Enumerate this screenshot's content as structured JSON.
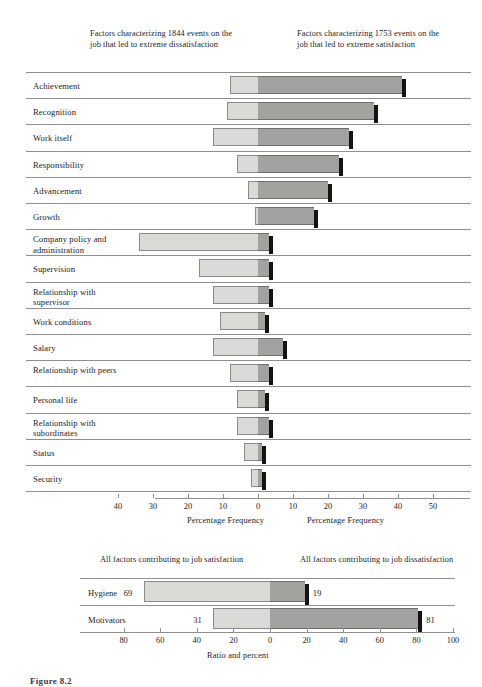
{
  "figure": {
    "caption": "Figure 8.2"
  },
  "top": {
    "left_header": "Factors characterizing 1844 events on the job that led to extreme dissatisfaction",
    "right_header": "Factors characterizing 1753 events on the job that led to extreme satisfaction",
    "left_axis_title": "Percentage Frequency",
    "right_axis_title": "Percentage Frequency"
  },
  "bottom": {
    "left_header": "All factors contributing to job satisfaction",
    "right_header": "All factors contributing to job dissatisfaction",
    "axis_title": "Ratio and percent"
  },
  "colors": {
    "light_bar": "#d9d9d7",
    "dark_bar": "#a2a2a0",
    "shadow": "#141414",
    "rule": "#8f8f8f",
    "text": "#1c1c22"
  },
  "chart_data": [
    {
      "type": "bar",
      "orientation": "horizontal-diverging",
      "title": "Factors affecting job attitudes as reported in 12 investigations",
      "xlabel": "Percentage Frequency",
      "left_label": "Factors characterizing 1844 events on the job that led to extreme dissatisfaction",
      "right_label": "Factors characterizing 1753 events on the job that led to extreme satisfaction",
      "left_ticks": [
        50,
        40,
        30,
        20,
        10,
        0
      ],
      "right_ticks": [
        0,
        10,
        20,
        30,
        40,
        50
      ],
      "xlim": [
        -50,
        50
      ],
      "grid": false,
      "legend": "none",
      "categories": [
        "Achievement",
        "Recognition",
        "Work itself",
        "Responsibility",
        "Advancement",
        "Growth",
        "Company policy and administration",
        "Supervision",
        "Relationship with supervisor",
        "Work conditions",
        "Salary",
        "Relationship with peers",
        "Personal life",
        "Relationship with subordinates",
        "Status",
        "Security"
      ],
      "series": [
        {
          "name": "Dissatisfaction (left, light)",
          "values": [
            8,
            9,
            13,
            6,
            3,
            1,
            34,
            17,
            13,
            11,
            13,
            8,
            6,
            6,
            4,
            2
          ]
        },
        {
          "name": "Satisfaction (right, dark)",
          "values": [
            41,
            33,
            26,
            23,
            20,
            16,
            3,
            3,
            3,
            2,
            7,
            3,
            2,
            3,
            1,
            1
          ]
        }
      ]
    },
    {
      "type": "bar",
      "orientation": "horizontal-diverging",
      "xlabel": "Ratio and percent",
      "left_label": "All factors contributing to job satisfaction",
      "right_label": "All factors contributing to job dissatisfaction",
      "left_ticks": [
        80,
        60,
        40,
        20,
        0
      ],
      "right_ticks": [
        0,
        20,
        40,
        60,
        80,
        100
      ],
      "xlim": [
        -100,
        100
      ],
      "grid": false,
      "legend": "none",
      "categories": [
        "Hygiene",
        "Motivators"
      ],
      "series": [
        {
          "name": "Satisfaction (left, light)",
          "values": [
            69,
            31
          ],
          "labels": [
            "69",
            "31"
          ]
        },
        {
          "name": "Dissatisfaction (right, dark)",
          "values": [
            19,
            81
          ],
          "labels": [
            "19",
            "81"
          ]
        }
      ]
    }
  ]
}
